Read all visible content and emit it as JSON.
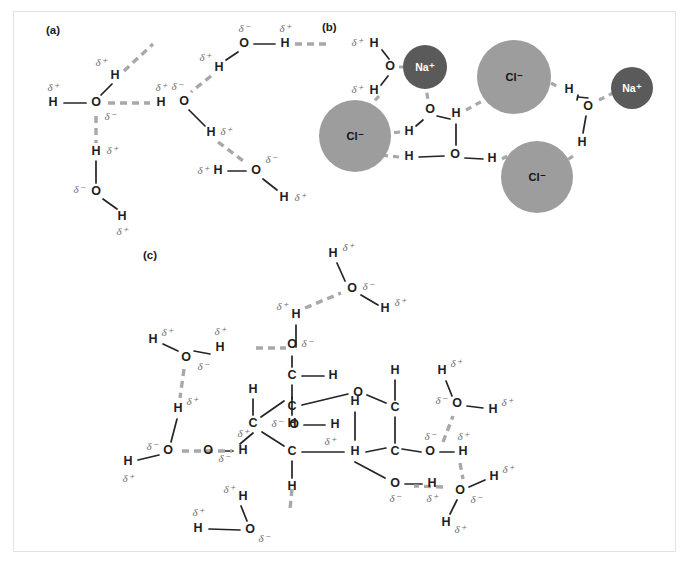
{
  "figure": {
    "background_color": "#ffffff",
    "frame_color": "#e2e2e2"
  },
  "symbols": {
    "delta_positive": "δ⁺",
    "delta_negative": "δ⁻",
    "oxygen": "O",
    "hydrogen": "H",
    "carbon": "C",
    "sodium_ion": "Na⁺",
    "chloride_ion": "Cl⁻"
  },
  "colors": {
    "covalent_bond": "#242424",
    "hydrogen_bond": "#a8a8a8",
    "delta_text": "#6e6e6e",
    "atom_text": "#1f1f1f",
    "sodium_fill": "#5a5a5a",
    "chloride_fill": "#9d9d9d",
    "chloride_text": "#141414",
    "sodium_text": "#ffffff"
  },
  "panels": [
    {
      "id": "panel-a",
      "label": "(a)",
      "label_x": 46,
      "label_y": 30,
      "caption": "Hydrogen bonding between water molecules"
    },
    {
      "id": "panel-b",
      "label": "(b)",
      "label_x": 322,
      "label_y": 27,
      "caption": "Water molecules surrounding dissolved sodium and chloride ions"
    },
    {
      "id": "panel-c",
      "label": "(c)",
      "label_x": 143,
      "label_y": 255,
      "caption": "Hydrogen bonding between water molecules and a sugar molecule"
    }
  ],
  "panel_a": {
    "atoms": [
      {
        "name": "o-center",
        "element": "O",
        "x": 96,
        "y": 103,
        "delta": "δ⁻",
        "delta_x": 110,
        "delta_y": 116
      },
      {
        "name": "h-left",
        "element": "H",
        "x": 53,
        "y": 103,
        "delta": "δ⁺",
        "delta_x": 53,
        "delta_y": 88
      },
      {
        "name": "h-up",
        "element": "H",
        "x": 115,
        "y": 76,
        "delta": "δ⁺",
        "delta_x": 101,
        "delta_y": 64
      },
      {
        "name": "h-right-partner",
        "element": "H",
        "x": 160,
        "y": 103,
        "delta": "δ⁺",
        "delta_x": 160,
        "delta_y": 88
      },
      {
        "name": "h-below",
        "element": "H",
        "x": 96,
        "y": 152,
        "delta": "δ⁺",
        "delta_x": 112,
        "delta_y": 152
      },
      {
        "name": "o-below",
        "element": "O",
        "x": 96,
        "y": 192,
        "delta": "δ⁻",
        "delta_x": 79,
        "delta_y": 190
      },
      {
        "name": "h-below-right",
        "element": "H",
        "x": 122,
        "y": 216,
        "delta": "δ⁺",
        "delta_x": 122,
        "delta_y": 231
      },
      {
        "name": "o-top-right",
        "element": "O",
        "x": 244,
        "y": 44,
        "delta": "δ⁻",
        "delta_x": 244,
        "delta_y": 30
      },
      {
        "name": "h-top-right",
        "element": "H",
        "x": 285,
        "y": 44,
        "delta": "δ⁺",
        "delta_x": 285,
        "delta_y": 30
      },
      {
        "name": "h-mid-right",
        "element": "H",
        "x": 219,
        "y": 67,
        "delta": "δ⁺",
        "delta_x": 205,
        "delta_y": 59
      },
      {
        "name": "o-mid-right",
        "element": "O",
        "x": 184,
        "y": 101,
        "delta": "δ⁻",
        "delta_x": 177,
        "delta_y": 88
      },
      {
        "name": "h-lower-right",
        "element": "H",
        "x": 212,
        "y": 133,
        "delta": "δ⁺",
        "delta_x": 226,
        "delta_y": 133
      },
      {
        "name": "o-bottom-right",
        "element": "O",
        "x": 256,
        "y": 171,
        "delta": "δ⁻",
        "delta_x": 271,
        "delta_y": 161
      },
      {
        "name": "h-bottom-left",
        "element": "H",
        "x": 218,
        "y": 171,
        "delta": "δ⁺",
        "delta_x": 202,
        "delta_y": 171
      },
      {
        "name": "h-bottom-right",
        "element": "H",
        "x": 284,
        "y": 197,
        "delta": "δ⁺",
        "delta_x": 299,
        "delta_y": 198
      }
    ]
  },
  "panel_b": {
    "ions": [
      {
        "name": "na-top",
        "label": "Na⁺",
        "cx": 425,
        "cy": 67,
        "r": 22,
        "type": "sodium"
      },
      {
        "name": "cl-left",
        "label": "Cl⁻",
        "cx": 355,
        "cy": 136,
        "r": 36,
        "type": "chloride"
      },
      {
        "name": "cl-top-right",
        "label": "Cl⁻",
        "cx": 514,
        "cy": 77,
        "r": 37,
        "type": "chloride"
      },
      {
        "name": "na-right",
        "label": "Na⁺",
        "cx": 632,
        "cy": 88,
        "r": 21,
        "type": "sodium"
      },
      {
        "name": "cl-bottom",
        "label": "Cl⁻",
        "cx": 537,
        "cy": 177,
        "r": 36,
        "type": "chloride"
      }
    ],
    "atoms": [
      {
        "name": "h-upper-left",
        "element": "H",
        "x": 374,
        "y": 44,
        "delta": "δ⁺",
        "delta_x": 357,
        "delta_y": 44
      },
      {
        "name": "o-upper-left",
        "element": "O",
        "x": 390,
        "y": 67,
        "delta": "",
        "delta_x": 0,
        "delta_y": 0
      },
      {
        "name": "h-second-left",
        "element": "H",
        "x": 374,
        "y": 90,
        "delta": "δ⁺",
        "delta_x": 357,
        "delta_y": 90
      },
      {
        "name": "o-upper-mid",
        "element": "O",
        "x": 430,
        "y": 110,
        "delta": "",
        "delta_x": 0,
        "delta_y": 0
      },
      {
        "name": "h-mid-left",
        "element": "H",
        "x": 411,
        "y": 132,
        "delta": "",
        "delta_x": 0,
        "delta_y": 0
      },
      {
        "name": "h-mid-center",
        "element": "H",
        "x": 456,
        "y": 113,
        "delta": "",
        "delta_x": 0,
        "delta_y": 0
      },
      {
        "name": "o-lower-mid",
        "element": "O",
        "x": 455,
        "y": 155,
        "delta": "",
        "delta_x": 0,
        "delta_y": 0
      },
      {
        "name": "h-lower-left",
        "element": "H",
        "x": 410,
        "y": 157,
        "delta": "",
        "delta_x": 0,
        "delta_y": 0
      },
      {
        "name": "h-lower-right",
        "element": "H",
        "x": 492,
        "y": 159,
        "delta": "",
        "delta_x": 0,
        "delta_y": 0
      },
      {
        "name": "h-right-top",
        "element": "H",
        "x": 569,
        "y": 90,
        "delta": "",
        "delta_x": 0,
        "delta_y": 0
      },
      {
        "name": "o-right",
        "element": "O",
        "x": 588,
        "y": 106,
        "delta": "",
        "delta_x": 0,
        "delta_y": 0
      },
      {
        "name": "h-right-bottom",
        "element": "H",
        "x": 582,
        "y": 143,
        "delta": "",
        "delta_x": 0,
        "delta_y": 0
      }
    ]
  },
  "panel_c": {
    "sugar_ring": {
      "description": "Pyranose sugar ring with hydroxyl groups",
      "atoms": [
        {
          "name": "ring-c1",
          "element": "C",
          "x": 292,
          "y": 376
        },
        {
          "name": "ring-c2",
          "element": "C",
          "x": 292,
          "y": 407
        },
        {
          "name": "ring-o-bridge",
          "element": "O",
          "x": 358,
          "y": 393
        },
        {
          "name": "ring-c3",
          "element": "C",
          "x": 395,
          "y": 408
        },
        {
          "name": "ring-c4",
          "element": "C",
          "x": 395,
          "y": 452
        },
        {
          "name": "ring-c5",
          "element": "C",
          "x": 292,
          "y": 452
        },
        {
          "name": "ring-c6",
          "element": "C",
          "x": 253,
          "y": 424
        },
        {
          "name": "ring-h-center",
          "element": "H",
          "x": 355,
          "y": 452
        }
      ]
    },
    "water_molecules": [
      {
        "name": "water-top",
        "o_x": 352,
        "o_y": 289,
        "h1_x": 334,
        "h1_y": 254,
        "h2_x": 385,
        "h2_y": 308
      },
      {
        "name": "water-upper-left",
        "o_x": 186,
        "o_y": 358,
        "h1_x": 153,
        "h1_y": 340,
        "h2_x": 216,
        "h2_y": 348
      },
      {
        "name": "water-mid-left",
        "o_x": 168,
        "o_y": 451,
        "h1_x": 128,
        "h1_y": 460,
        "h2_x": 177,
        "h2_y": 409
      },
      {
        "name": "water-bottom-left",
        "o_x": 250,
        "o_y": 530,
        "h1_x": 198,
        "h1_y": 528,
        "h2_x": 242,
        "h2_y": 497
      },
      {
        "name": "water-right-upper",
        "o_x": 457,
        "o_y": 404,
        "h1_x": 443,
        "h1_y": 371,
        "h2_x": 492,
        "h2_y": 409
      },
      {
        "name": "water-right-lower",
        "o_x": 460,
        "o_y": 491,
        "h1_x": 494,
        "h1_y": 477,
        "h2_x": 447,
        "h2_y": 522
      }
    ],
    "hydroxyls": [
      {
        "name": "oh-top",
        "o_x": 296,
        "o_y": 345,
        "h_x": 296,
        "h_y": 315
      },
      {
        "name": "oh-left-ring",
        "o_x": 208,
        "o_y": 451,
        "h_x": 243,
        "h_y": 451
      },
      {
        "name": "oh-inner",
        "o_x": 294,
        "o_y": 425,
        "h_x": 335,
        "h_y": 425
      },
      {
        "name": "oh-bottom-right",
        "o_x": 395,
        "o_y": 484,
        "h_x": 432,
        "h_y": 484
      },
      {
        "name": "oh-right",
        "o_x": 430,
        "o_y": 452,
        "h_x": 463,
        "h_y": 452
      }
    ]
  }
}
